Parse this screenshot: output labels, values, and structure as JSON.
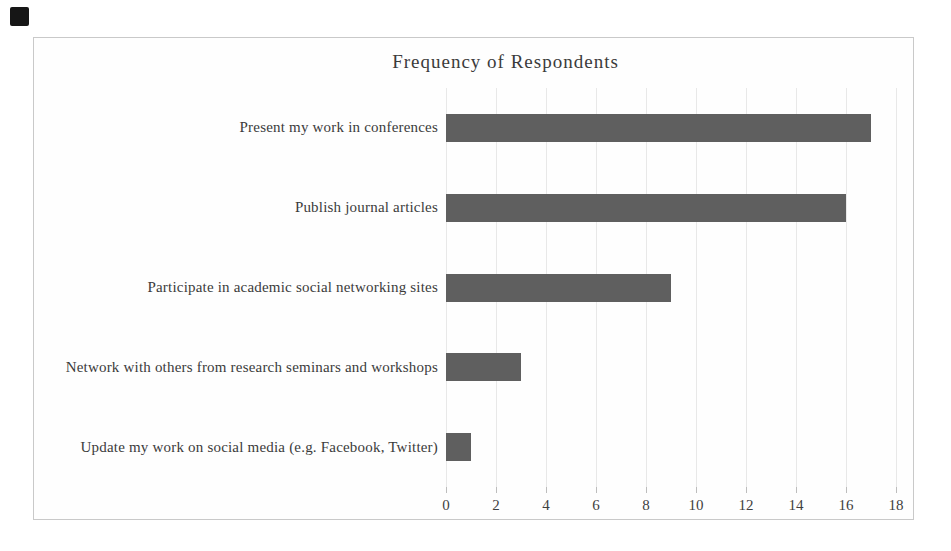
{
  "colors": {
    "bar": "#5f5f5f",
    "gridline": "#e8e8e8",
    "frame_border": "#c9c9c9",
    "text": "#3b3b3b",
    "chart_background": "#fefefe",
    "page_background": "#ffffff",
    "scan_mark": "#161616"
  },
  "chart_data": {
    "type": "bar",
    "orientation": "horizontal",
    "title": "Frequency of Respondents",
    "categories": [
      "Present my work in conferences",
      "Publish journal articles",
      "Participate in academic social networking sites",
      "Network with others from research seminars and workshops",
      "Update my work on social media (e.g. Facebook, Twitter)"
    ],
    "values": [
      17,
      16,
      9,
      3,
      1
    ],
    "xlabel": "",
    "ylabel": "",
    "xlim": [
      0,
      18
    ],
    "xticks": [
      0,
      2,
      4,
      6,
      8,
      10,
      12,
      14,
      16,
      18
    ],
    "grid": "vertical-only",
    "legend": "none"
  }
}
